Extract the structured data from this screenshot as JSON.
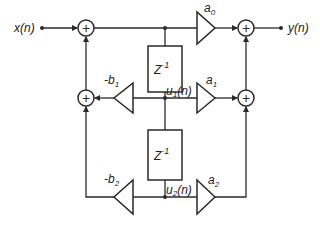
{
  "diagram": {
    "type": "signal-flow / direct-form II biquad filter",
    "input_label": "x(n)",
    "output_label": "y(n)",
    "delays": [
      {
        "label": "Z",
        "exp": "-1",
        "state": "u1(n)",
        "state_base": "u",
        "state_sub": "1",
        "state_arg": "(n)"
      },
      {
        "label": "Z",
        "exp": "-1",
        "state": "u2(n)",
        "state_base": "u",
        "state_sub": "2",
        "state_arg": "(n)"
      }
    ],
    "feedforward_gains": [
      {
        "label": "a0",
        "base": "a",
        "sub": "0"
      },
      {
        "label": "a1",
        "base": "a",
        "sub": "1"
      },
      {
        "label": "a2",
        "base": "a",
        "sub": "2"
      }
    ],
    "feedback_gains": [
      {
        "label": "-b1",
        "base": "-b",
        "sub": "1"
      },
      {
        "label": "-b2",
        "base": "-b",
        "sub": "2"
      }
    ],
    "adder_symbol": "+"
  }
}
